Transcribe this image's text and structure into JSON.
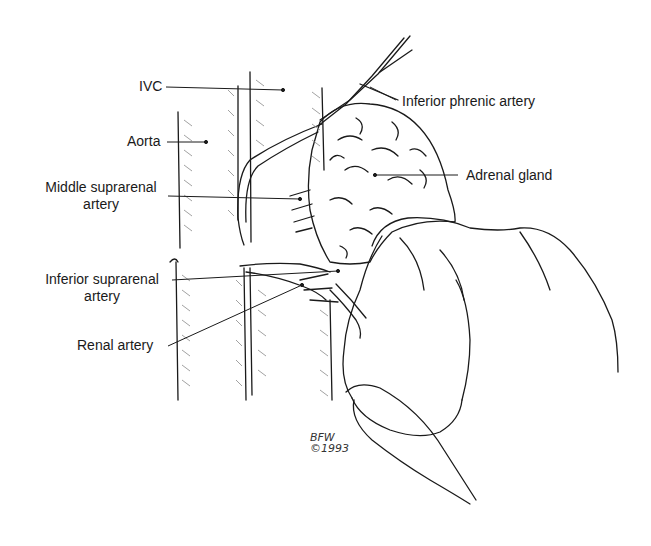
{
  "figure": {
    "labels": {
      "ivc": "IVC",
      "aorta": "Aorta",
      "middle_suprarenal_line1": "Middle suprarenal",
      "middle_suprarenal_line2": "artery",
      "inferior_suprarenal_line1": "Inferior suprarenal",
      "inferior_suprarenal_line2": "artery",
      "renal_artery": "Renal artery",
      "inferior_phrenic_artery": "Inferior phrenic artery",
      "adrenal_gland": "Adrenal gland"
    },
    "signature": {
      "initials": "BFW",
      "year": "©1993"
    },
    "colors": {
      "ink": "#1a1a1a",
      "background": "#ffffff",
      "hatch": "#8a8a8a"
    }
  }
}
